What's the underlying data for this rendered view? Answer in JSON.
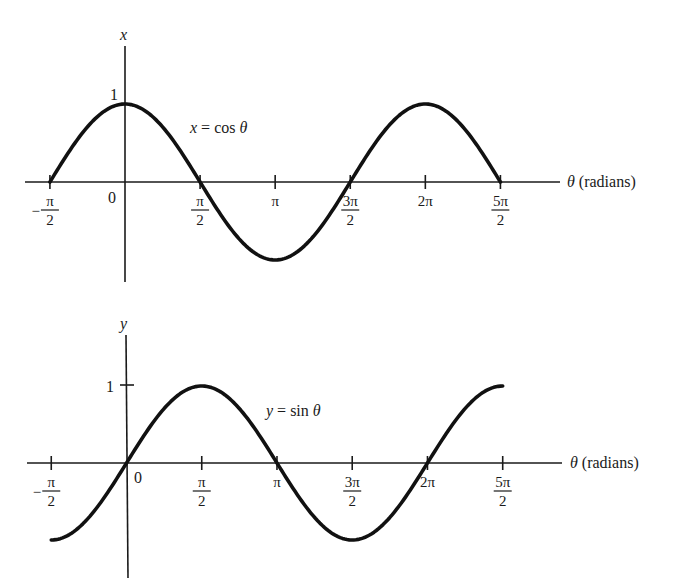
{
  "chart_data": [
    {
      "type": "line",
      "title": "x = cos θ",
      "equation_label": {
        "lhs": "x",
        "eq": " = cos ",
        "var": "θ"
      },
      "xlabel": {
        "var": "θ",
        "unit": " (radians)"
      },
      "ylabel": "x",
      "ytick_label": "1",
      "origin_label": "0",
      "x_ticks": [
        {
          "value": -1.5708,
          "num": "π",
          "den": "2",
          "neg": true
        },
        {
          "value": 1.5708,
          "num": "π",
          "den": "2",
          "neg": false
        },
        {
          "value": 3.1416,
          "label": "π"
        },
        {
          "value": 4.7124,
          "num": "3π",
          "den": "2",
          "neg": false
        },
        {
          "value": 6.2832,
          "label": "2π"
        },
        {
          "value": 7.854,
          "num": "5π",
          "den": "2",
          "neg": false
        }
      ],
      "x_range": [
        -1.5708,
        7.854
      ],
      "ylim": [
        -1,
        1
      ],
      "series": [
        {
          "name": "cos θ",
          "function": "cos",
          "x": [
            -1.5708,
            0,
            1.5708,
            3.1416,
            4.7124,
            6.2832,
            7.854
          ],
          "values": [
            0,
            1,
            0,
            -1,
            0,
            1,
            0
          ]
        }
      ],
      "grid": false,
      "legend": "none"
    },
    {
      "type": "line",
      "title": "y = sin θ",
      "equation_label": {
        "lhs": "y",
        "eq": " = sin ",
        "var": "θ"
      },
      "xlabel": {
        "var": "θ",
        "unit": " (radians)"
      },
      "ylabel": "y",
      "ytick_label": "1",
      "origin_label": "0",
      "x_ticks": [
        {
          "value": -1.5708,
          "num": "π",
          "den": "2",
          "neg": true
        },
        {
          "value": 1.5708,
          "num": "π",
          "den": "2",
          "neg": false
        },
        {
          "value": 3.1416,
          "label": "π"
        },
        {
          "value": 4.7124,
          "num": "3π",
          "den": "2",
          "neg": false
        },
        {
          "value": 6.2832,
          "label": "2π"
        },
        {
          "value": 7.854,
          "num": "5π",
          "den": "2",
          "neg": false
        }
      ],
      "x_range": [
        -1.5708,
        7.854
      ],
      "ylim": [
        -1,
        1
      ],
      "series": [
        {
          "name": "sin θ",
          "function": "sin",
          "x": [
            -1.5708,
            0,
            1.5708,
            3.1416,
            4.7124,
            6.2832,
            7.854
          ],
          "values": [
            -1,
            0,
            1,
            0,
            -1,
            0,
            1
          ]
        }
      ],
      "grid": false,
      "legend": "none"
    }
  ]
}
